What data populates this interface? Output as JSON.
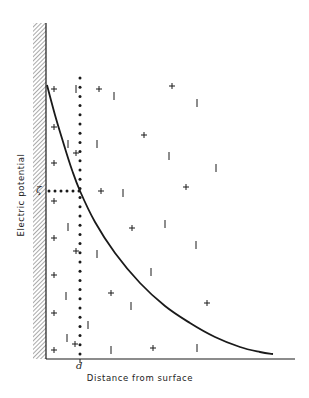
{
  "chart_data": {
    "type": "diagram",
    "title": "",
    "xlabel": "Distance from surface",
    "ylabel": "Electric potential",
    "x_marker": {
      "label": "d",
      "x": 80
    },
    "y_marker": {
      "label": "ζ",
      "y": 191
    },
    "axes": {
      "origin": [
        46,
        359
      ],
      "y_top": 23,
      "x_right": 295,
      "wall": {
        "x0": 33,
        "x1": 46,
        "y0": 23,
        "y1": 359,
        "hatch": "diagonal"
      }
    },
    "curve": {
      "description": "Electric potential decays with distance from charged surface",
      "points": [
        [
          47,
          85
        ],
        [
          55,
          115
        ],
        [
          64,
          145
        ],
        [
          72,
          170
        ],
        [
          80,
          191
        ],
        [
          95,
          222
        ],
        [
          115,
          253
        ],
        [
          140,
          283
        ],
        [
          165,
          306
        ],
        [
          190,
          323
        ],
        [
          215,
          337
        ],
        [
          240,
          347
        ],
        [
          260,
          352
        ],
        [
          273,
          354
        ]
      ]
    },
    "dotted_lines": {
      "vertical": {
        "x": 80,
        "y0": 78,
        "y1": 356,
        "spacing": 9.2
      },
      "horizontal": {
        "y": 191,
        "x0": 46,
        "x1": 80,
        "spacing": 6
      }
    },
    "charges": [
      {
        "sign": "+",
        "x": 54,
        "y": 89
      },
      {
        "sign": "-",
        "x": 76,
        "y": 89
      },
      {
        "sign": "+",
        "x": 99,
        "y": 89
      },
      {
        "sign": "+",
        "x": 172,
        "y": 86
      },
      {
        "sign": "-",
        "x": 114,
        "y": 96
      },
      {
        "sign": "-",
        "x": 197,
        "y": 103
      },
      {
        "sign": "+",
        "x": 54,
        "y": 127
      },
      {
        "sign": "+",
        "x": 144,
        "y": 135
      },
      {
        "sign": "-",
        "x": 68,
        "y": 144
      },
      {
        "sign": "-",
        "x": 97,
        "y": 144
      },
      {
        "sign": "+",
        "x": 76,
        "y": 153
      },
      {
        "sign": "-",
        "x": 169,
        "y": 156
      },
      {
        "sign": "+",
        "x": 54,
        "y": 163
      },
      {
        "sign": "-",
        "x": 216,
        "y": 168
      },
      {
        "sign": "+",
        "x": 101,
        "y": 191
      },
      {
        "sign": "-",
        "x": 123,
        "y": 193
      },
      {
        "sign": "+",
        "x": 186,
        "y": 187
      },
      {
        "sign": "+",
        "x": 54,
        "y": 201
      },
      {
        "sign": "+",
        "x": 132,
        "y": 228
      },
      {
        "sign": "-",
        "x": 165,
        "y": 224
      },
      {
        "sign": "-",
        "x": 68,
        "y": 227
      },
      {
        "sign": "-",
        "x": 97,
        "y": 254
      },
      {
        "sign": "+",
        "x": 54,
        "y": 238
      },
      {
        "sign": "+",
        "x": 76,
        "y": 251
      },
      {
        "sign": "-",
        "x": 196,
        "y": 245
      },
      {
        "sign": "-",
        "x": 151,
        "y": 272
      },
      {
        "sign": "+",
        "x": 54,
        "y": 275
      },
      {
        "sign": "+",
        "x": 111,
        "y": 293
      },
      {
        "sign": "-",
        "x": 66,
        "y": 296
      },
      {
        "sign": "-",
        "x": 131,
        "y": 306
      },
      {
        "sign": "+",
        "x": 207,
        "y": 303
      },
      {
        "sign": "+",
        "x": 54,
        "y": 313
      },
      {
        "sign": "-",
        "x": 88,
        "y": 325
      },
      {
        "sign": "-",
        "x": 67,
        "y": 338
      },
      {
        "sign": "+",
        "x": 75,
        "y": 344
      },
      {
        "sign": "+",
        "x": 54,
        "y": 350
      },
      {
        "sign": "-",
        "x": 111,
        "y": 350
      },
      {
        "sign": "+",
        "x": 153,
        "y": 348
      },
      {
        "sign": "-",
        "x": 197,
        "y": 348
      }
    ],
    "colors": {
      "ink": "#1a1a1a",
      "hatch": "#555555",
      "background": "#ffffff"
    }
  }
}
